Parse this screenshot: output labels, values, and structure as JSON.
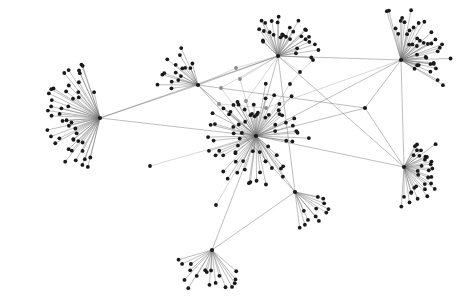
{
  "figure": {
    "type": "network-graph",
    "width": 468,
    "height": 305,
    "background_color": "#ffffff",
    "node_color": "#1a1a1a",
    "node_color_light": "#8a8a8a",
    "edge_color": "#6e6e6e",
    "edge_color_light": "#a8a8a8",
    "node_radius": 1.9,
    "hub_radius": 2.1,
    "edge_width": 0.45,
    "title": "",
    "labels_visible": false
  },
  "graph_data": {
    "type": "node-link-diagram",
    "layout": "force-directed",
    "node_count": 268,
    "edge_count": 290,
    "hub_count": 9,
    "hubs": [
      {
        "id": "h-left",
        "name": "left-hub",
        "x": 100,
        "y": 118,
        "degree": 46,
        "fan_center_deg": 180,
        "fan_spread_deg": 155,
        "fan_r_min": 26,
        "fan_r_max": 58
      },
      {
        "id": "h-center",
        "name": "center-hub",
        "x": 256,
        "y": 136,
        "degree": 72,
        "fan_center_deg": 205,
        "fan_spread_deg": 330,
        "fan_r_min": 14,
        "fan_r_max": 54
      },
      {
        "id": "h-top-center",
        "name": "top-center-hub",
        "x": 278,
        "y": 56,
        "degree": 30,
        "fan_center_deg": 292,
        "fan_spread_deg": 135,
        "fan_r_min": 18,
        "fan_r_max": 42
      },
      {
        "id": "h-top-right",
        "name": "top-right-hub",
        "x": 401,
        "y": 60,
        "degree": 40,
        "fan_center_deg": 325,
        "fan_spread_deg": 140,
        "fan_r_min": 16,
        "fan_r_max": 52
      },
      {
        "id": "h-right",
        "name": "right-hub",
        "x": 404,
        "y": 167,
        "degree": 32,
        "fan_center_deg": 15,
        "fan_spread_deg": 155,
        "fan_r_min": 14,
        "fan_r_max": 40
      },
      {
        "id": "h-bottom",
        "name": "bottom-hub",
        "x": 212,
        "y": 250,
        "degree": 18,
        "fan_center_deg": 100,
        "fan_spread_deg": 120,
        "fan_r_min": 20,
        "fan_r_max": 46
      },
      {
        "id": "h-upper-left",
        "name": "upper-left-hub",
        "x": 198,
        "y": 85,
        "degree": 16,
        "fan_center_deg": 215,
        "fan_spread_deg": 78,
        "fan_r_min": 18,
        "fan_r_max": 42
      },
      {
        "id": "h-lower-right",
        "name": "lower-right-hub",
        "x": 295,
        "y": 192,
        "degree": 12,
        "fan_center_deg": 45,
        "fan_spread_deg": 70,
        "fan_r_min": 18,
        "fan_r_max": 40
      },
      {
        "id": "h-junction",
        "name": "junction-node",
        "x": 365,
        "y": 108,
        "degree": 5,
        "fan_center_deg": 0,
        "fan_spread_deg": 0,
        "fan_r_min": 0,
        "fan_r_max": 0
      }
    ],
    "bridge_nodes": [
      {
        "id": "b1",
        "name": "bridge-node-a",
        "x": 221,
        "y": 88,
        "shade": "light"
      },
      {
        "id": "b2",
        "name": "bridge-node-b",
        "x": 219,
        "y": 104,
        "shade": "light"
      },
      {
        "id": "b3",
        "name": "bridge-node-c",
        "x": 240,
        "y": 79,
        "shade": "light"
      },
      {
        "id": "b4",
        "name": "bridge-node-d",
        "x": 246,
        "y": 101,
        "shade": "light"
      },
      {
        "id": "b5",
        "name": "bridge-node-e",
        "x": 266,
        "y": 108,
        "shade": "light"
      },
      {
        "id": "b6",
        "name": "bridge-node-f",
        "x": 290,
        "y": 84,
        "shade": "dark"
      },
      {
        "id": "b7",
        "name": "bridge-node-g",
        "x": 313,
        "y": 60,
        "shade": "dark"
      },
      {
        "id": "b8",
        "name": "bridge-node-h",
        "x": 300,
        "y": 72,
        "shade": "dark"
      },
      {
        "id": "b9",
        "name": "isolate-node-a",
        "x": 216,
        "y": 205,
        "shade": "dark"
      },
      {
        "id": "b10",
        "name": "isolate-node-b",
        "x": 150,
        "y": 166,
        "shade": "dark"
      },
      {
        "id": "b11",
        "name": "bridge-node-i",
        "x": 236,
        "y": 68,
        "shade": "light"
      }
    ],
    "inter_hub_edges": [
      {
        "source": "h-left",
        "target": "h-top-center"
      },
      {
        "source": "h-left",
        "target": "h-center"
      },
      {
        "source": "h-left",
        "target": "h-upper-left"
      },
      {
        "source": "h-center",
        "target": "h-top-center"
      },
      {
        "source": "h-center",
        "target": "h-top-right"
      },
      {
        "source": "h-center",
        "target": "h-right"
      },
      {
        "source": "h-center",
        "target": "h-bottom"
      },
      {
        "source": "h-center",
        "target": "h-upper-left"
      },
      {
        "source": "h-center",
        "target": "h-lower-right"
      },
      {
        "source": "h-center",
        "target": "h-junction"
      },
      {
        "source": "h-top-center",
        "target": "h-top-right"
      },
      {
        "source": "h-top-center",
        "target": "h-upper-left"
      },
      {
        "source": "h-top-center",
        "target": "h-lower-right"
      },
      {
        "source": "h-top-center",
        "target": "h-right"
      },
      {
        "source": "h-top-right",
        "target": "h-junction"
      },
      {
        "source": "h-top-right",
        "target": "h-right"
      },
      {
        "source": "h-junction",
        "target": "h-right"
      },
      {
        "source": "h-junction",
        "target": "h-upper-left"
      },
      {
        "source": "h-upper-left",
        "target": "h-lower-right"
      },
      {
        "source": "h-bottom",
        "target": "h-lower-right"
      }
    ],
    "bridge_edges": [
      {
        "source": "b1",
        "target": "h-center"
      },
      {
        "source": "b1",
        "target": "h-top-center"
      },
      {
        "source": "b2",
        "target": "h-center"
      },
      {
        "source": "b2",
        "target": "h-upper-left"
      },
      {
        "source": "b2",
        "target": "b5"
      },
      {
        "source": "b3",
        "target": "h-top-center"
      },
      {
        "source": "b3",
        "target": "h-center"
      },
      {
        "source": "b4",
        "target": "h-center"
      },
      {
        "source": "b4",
        "target": "h-top-center"
      },
      {
        "source": "b5",
        "target": "h-center"
      },
      {
        "source": "b5",
        "target": "h-top-right"
      },
      {
        "source": "b6",
        "target": "h-center"
      },
      {
        "source": "b6",
        "target": "b8"
      },
      {
        "source": "b7",
        "target": "b8"
      },
      {
        "source": "b8",
        "target": "h-top-center"
      },
      {
        "source": "b9",
        "target": "h-center"
      },
      {
        "source": "b10",
        "target": "h-center"
      },
      {
        "source": "b11",
        "target": "h-top-center"
      },
      {
        "source": "b11",
        "target": "h-upper-left"
      }
    ]
  }
}
